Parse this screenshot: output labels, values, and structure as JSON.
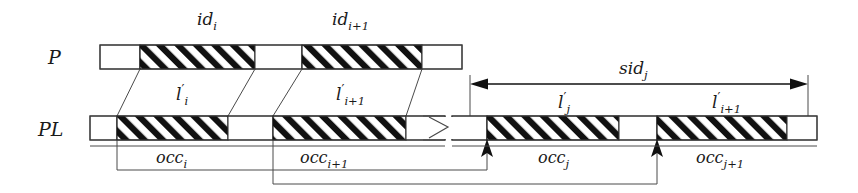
{
  "figure": {
    "rows": [
      {
        "key": "p",
        "label": "P"
      },
      {
        "key": "pl",
        "label": "PL"
      }
    ],
    "top_labels": [
      {
        "name": "id-i",
        "base": "id",
        "sub": "i",
        "x": 215
      },
      {
        "name": "id-i-plus-1",
        "base": "id",
        "sub": "i+1",
        "x": 357
      }
    ],
    "mid_labels": [
      {
        "name": "l-prime-i",
        "base": "l",
        "prime": "′",
        "sub": "i",
        "x": 186
      },
      {
        "name": "l-prime-i-plus-1",
        "base": "l",
        "prime": "′",
        "sub": "i+1",
        "x": 352
      },
      {
        "name": "l-prime-j",
        "base": "l",
        "prime": "′",
        "sub": "j",
        "x": 567
      },
      {
        "name": "l-prime-i-plus-1-right",
        "base": "l",
        "prime": "′",
        "sub": "i+1",
        "x": 728
      }
    ],
    "span_label": {
      "name": "sid-j",
      "base": "sid",
      "sub": "j",
      "x": 641,
      "y": 70
    },
    "occ_labels": [
      {
        "name": "occ-i",
        "base": "occ",
        "sub": "i",
        "x": 186
      },
      {
        "name": "occ-i-plus-1",
        "base": "occ",
        "sub": "i+1",
        "x": 339
      },
      {
        "name": "occ-j",
        "base": "occ",
        "sub": "j",
        "x": 567
      },
      {
        "name": "occ-j-plus-1",
        "base": "occ",
        "sub": "j+1",
        "x": 735
      }
    ],
    "p_row": {
      "name": "pattern-bar",
      "x": 100,
      "y": 45,
      "width": 362,
      "height": 24,
      "segments": [
        {
          "name": "p-seg-plain-1",
          "x": 100,
          "width": 40,
          "hatched": false
        },
        {
          "name": "p-seg-hatched-i",
          "x": 140,
          "width": 115,
          "hatched": true
        },
        {
          "name": "p-seg-plain-2",
          "x": 255,
          "width": 47,
          "hatched": false
        },
        {
          "name": "p-seg-hatched-i-plus-1",
          "x": 302,
          "width": 120,
          "hatched": true
        },
        {
          "name": "p-seg-plain-3",
          "x": 422,
          "width": 40,
          "hatched": false
        }
      ]
    },
    "pl_row": {
      "name": "pattern-list-bar",
      "y": 116,
      "height": 24,
      "left_part": {
        "x": 90,
        "width": 355
      },
      "right_part": {
        "x": 452,
        "width": 365
      },
      "segments": [
        {
          "name": "pl-seg-plain-1",
          "x": 90,
          "width": 27,
          "hatched": false
        },
        {
          "name": "pl-seg-hatched-i",
          "x": 117,
          "width": 111,
          "hatched": true
        },
        {
          "name": "pl-seg-plain-2",
          "x": 228,
          "width": 45,
          "hatched": false
        },
        {
          "name": "pl-seg-hatched-i-plus-1",
          "x": 273,
          "width": 133,
          "hatched": true
        },
        {
          "name": "pl-seg-plain-3",
          "x": 406,
          "width": 39,
          "hatched": false
        },
        {
          "name": "pl-seg-plain-4",
          "x": 452,
          "width": 35,
          "hatched": false
        },
        {
          "name": "pl-seg-hatched-j",
          "x": 487,
          "width": 132,
          "hatched": true
        },
        {
          "name": "pl-seg-plain-5",
          "x": 619,
          "width": 38,
          "hatched": false
        },
        {
          "name": "pl-seg-hatched-j-plus-1",
          "x": 657,
          "width": 130,
          "hatched": true
        },
        {
          "name": "pl-seg-plain-6",
          "x": 787,
          "width": 30,
          "hatched": false
        }
      ]
    },
    "break_symbol": {
      "name": "zigzag-break-icon",
      "x": 432,
      "y": 116,
      "width": 24,
      "height": 24
    },
    "span_arrow": {
      "name": "sid-j-span-arrow",
      "x1": 472,
      "x2": 806,
      "y": 84
    },
    "up_arrows": [
      {
        "name": "occ-i-target-arrow",
        "x": 487,
        "y": 141
      },
      {
        "name": "occ-i-plus-1-target-arrow",
        "x": 657,
        "y": 141
      }
    ],
    "colors": {
      "stroke": "#3a3a3a",
      "hatch": "#111111",
      "background": "#ffffff"
    }
  }
}
